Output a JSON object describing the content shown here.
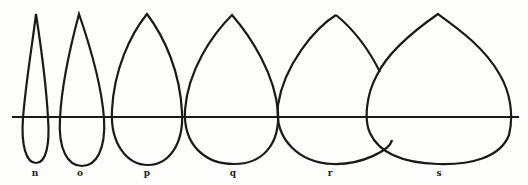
{
  "figure": {
    "type": "row of arch/leaf profiles crossing a horizontal baseline",
    "baseline": {
      "y": 117,
      "x1": 12,
      "x2": 519
    },
    "shapes": [
      {
        "label": "n",
        "label_x": 35
      },
      {
        "label": "o",
        "label_x": 80
      },
      {
        "label": "p",
        "label_x": 147
      },
      {
        "label": "q",
        "label_x": 233
      },
      {
        "label": "r",
        "label_x": 330
      },
      {
        "label": "s",
        "label_x": 439
      }
    ],
    "stroke_color": "#1a1a1a",
    "background_color": "#fdfdfc"
  }
}
